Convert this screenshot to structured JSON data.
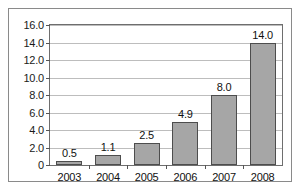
{
  "chart_data": {
    "type": "bar",
    "title": "",
    "subtitle": "",
    "xlabel": "",
    "ylabel": "",
    "categories": [
      "2003",
      "2004",
      "2005",
      "2006",
      "2007",
      "2008"
    ],
    "values": [
      0.5,
      1.1,
      2.5,
      4.9,
      8.0,
      14.0
    ],
    "data_labels": [
      "0.5",
      "1.1",
      "2.5",
      "4.9",
      "8.0",
      "14.0"
    ],
    "series": [
      {
        "name": "",
        "values": [
          0.5,
          1.1,
          2.5,
          4.9,
          8.0,
          14.0
        ]
      }
    ],
    "ylim": [
      0,
      16
    ],
    "ytick_values": [
      0,
      2,
      4,
      6,
      8,
      10,
      12,
      14,
      16
    ],
    "ytick_labels": [
      "0",
      "2.0",
      "4.0",
      "6.0",
      "8.0",
      "10.0",
      "12.0",
      "14.0",
      "16.0"
    ],
    "grid": true,
    "grid_axis": "y",
    "legend": false,
    "legend_position": "none",
    "annotations": [],
    "colors": {
      "bar_fill": "#a6a6a6",
      "bar_border": "#4d4d4d",
      "gridline": "#bdbdbd",
      "plot_frame": "#6e6e6e",
      "outer_border": "#8a8a8a",
      "background": "#ffffff",
      "text": "#111111"
    }
  }
}
